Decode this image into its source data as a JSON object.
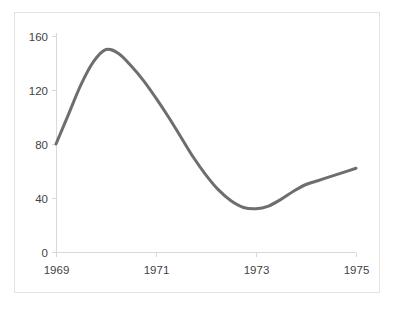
{
  "chart_data": {
    "type": "line",
    "title": "",
    "subtitle": "",
    "xlabel": "",
    "ylabel": "",
    "xlim": [
      1969,
      1975
    ],
    "ylim": [
      0,
      160
    ],
    "grid": false,
    "legend": null,
    "x_ticks": [
      "1969",
      "1971",
      "1973",
      "1975"
    ],
    "x_tick_values": [
      1969,
      1971,
      1973,
      1975
    ],
    "y_ticks": [
      "0",
      "40",
      "80",
      "120",
      "160"
    ],
    "y_tick_values": [
      0,
      40,
      80,
      120,
      160
    ],
    "series": [
      {
        "name": "series-1",
        "color": "#6e6e6e",
        "line_width": 3,
        "x": [
          1969.0,
          1969.25,
          1969.5,
          1969.75,
          1970.0,
          1970.25,
          1970.5,
          1970.75,
          1971.0,
          1971.25,
          1971.5,
          1971.75,
          1972.0,
          1972.25,
          1972.5,
          1972.75,
          1973.0,
          1973.25,
          1973.5,
          1973.75,
          1974.0,
          1974.25,
          1974.5,
          1974.75,
          1975.0
        ],
        "values": [
          80,
          102,
          124,
          141,
          150,
          147,
          138,
          127,
          114,
          100,
          85,
          70,
          57,
          46,
          38,
          33,
          32,
          34,
          39,
          45,
          50,
          53,
          56,
          59,
          62
        ]
      }
    ],
    "annotations": []
  },
  "geometry": {
    "plot_left": 56,
    "plot_right": 356,
    "plot_top": 28,
    "plot_bottom": 252,
    "value_top": 160,
    "value_bottom": 0
  },
  "colors": {
    "line": "#6e6e6e",
    "axis": "#d9d9d9",
    "border": "#e3e3e3",
    "text": "#3f3f3f",
    "background": "#ffffff"
  }
}
